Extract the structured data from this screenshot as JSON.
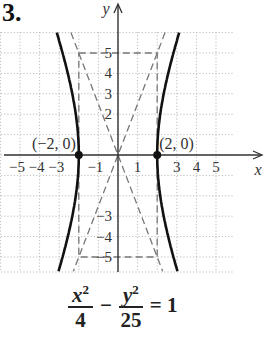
{
  "problem_number": "3.",
  "equation": {
    "term1_num": "x",
    "term1_exp": "2",
    "term1_den": "4",
    "operator": "−",
    "term2_num": "y",
    "term2_exp": "2",
    "term2_den": "25",
    "equals": "= 1"
  },
  "chart_data": {
    "type": "line",
    "xlabel": "x",
    "ylabel": "y",
    "xlim": [
      -6,
      6
    ],
    "ylim": [
      -6,
      6
    ],
    "grid": true,
    "x_tick_labels": [
      "-5",
      "-4",
      "-3",
      "-1",
      "1",
      "3",
      "4",
      "5"
    ],
    "y_tick_labels": [
      "5",
      "4",
      "3",
      "2",
      "-3",
      "-4",
      "-5"
    ],
    "series": [
      {
        "name": "hyperbola right branch",
        "style": "solid",
        "equation": "x = 2*sqrt(1 + y^2/25)"
      },
      {
        "name": "hyperbola left branch",
        "style": "solid",
        "equation": "x = -2*sqrt(1 + y^2/25)"
      },
      {
        "name": "asymptote",
        "style": "dashed",
        "equation": "y = 2.5x"
      },
      {
        "name": "asymptote",
        "style": "dashed",
        "equation": "y = -2.5x"
      },
      {
        "name": "fundamental rectangle",
        "style": "dashed",
        "corners": [
          [
            -2,
            5
          ],
          [
            2,
            5
          ],
          [
            2,
            -5
          ],
          [
            -2,
            -5
          ]
        ]
      }
    ],
    "points": [
      {
        "label": "(−2, 0)",
        "x": -2,
        "y": 0
      },
      {
        "label": "(2, 0)",
        "x": 2,
        "y": 0
      }
    ]
  }
}
